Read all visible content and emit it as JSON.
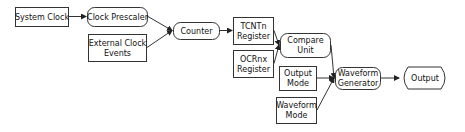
{
  "diagram": {
    "nodes": [
      {
        "id": "system_clock",
        "lines": [
          "System Clock"
        ],
        "shape": "rect",
        "x": 15,
        "y": 7,
        "w": 53,
        "h": 19
      },
      {
        "id": "clock_prescaler",
        "lines": [
          "Clock Prescaler"
        ],
        "shape": "rounded",
        "x": 87,
        "y": 7,
        "w": 60,
        "h": 19
      },
      {
        "id": "external_clock_events",
        "lines": [
          "External Clock",
          "Events"
        ],
        "shape": "rect",
        "x": 88,
        "y": 34,
        "w": 58,
        "h": 27
      },
      {
        "id": "counter",
        "lines": [
          "Counter"
        ],
        "shape": "rounded",
        "x": 173,
        "y": 22,
        "w": 46,
        "h": 17
      },
      {
        "id": "tcntn_register",
        "lines": [
          "TCNTn",
          "Register"
        ],
        "shape": "rect",
        "x": 233,
        "y": 17,
        "w": 40,
        "h": 27
      },
      {
        "id": "ocrnx_register",
        "lines": [
          "OCRnx",
          "Register"
        ],
        "shape": "rect",
        "x": 233,
        "y": 50,
        "w": 40,
        "h": 27
      },
      {
        "id": "compare_unit",
        "lines": [
          "Compare",
          "Unit"
        ],
        "shape": "rounded",
        "x": 280,
        "y": 33,
        "w": 50,
        "h": 24
      },
      {
        "id": "output_mode",
        "lines": [
          "Output",
          "Mode"
        ],
        "shape": "rect",
        "x": 279,
        "y": 66,
        "w": 37,
        "h": 24
      },
      {
        "id": "waveform_mode",
        "lines": [
          "Waveform",
          "Mode"
        ],
        "shape": "rect",
        "x": 276,
        "y": 97,
        "w": 40,
        "h": 26
      },
      {
        "id": "waveform_generator",
        "lines": [
          "Waveform",
          "Generator"
        ],
        "shape": "rounded",
        "x": 335,
        "y": 67,
        "w": 45,
        "h": 22
      },
      {
        "id": "output",
        "lines": [
          "Output"
        ],
        "shape": "hexagon",
        "x": 400,
        "y": 67,
        "w": 49,
        "h": 22
      }
    ],
    "edges": [
      {
        "from": "system_clock",
        "to": "clock_prescaler"
      },
      {
        "from": "clock_prescaler",
        "to": "counter"
      },
      {
        "from": "external_clock_events",
        "to": "counter"
      },
      {
        "from": "counter",
        "to": "tcntn_register"
      },
      {
        "from": "tcntn_register",
        "to": "compare_unit"
      },
      {
        "from": "ocrnx_register",
        "to": "compare_unit"
      },
      {
        "from": "compare_unit",
        "to": "waveform_generator"
      },
      {
        "from": "output_mode",
        "to": "waveform_generator"
      },
      {
        "from": "waveform_mode",
        "to": "waveform_generator"
      },
      {
        "from": "waveform_generator",
        "to": "output"
      }
    ],
    "colors": {
      "stroke": "#333333",
      "fill": "#ffffff",
      "text": "#111111"
    }
  }
}
